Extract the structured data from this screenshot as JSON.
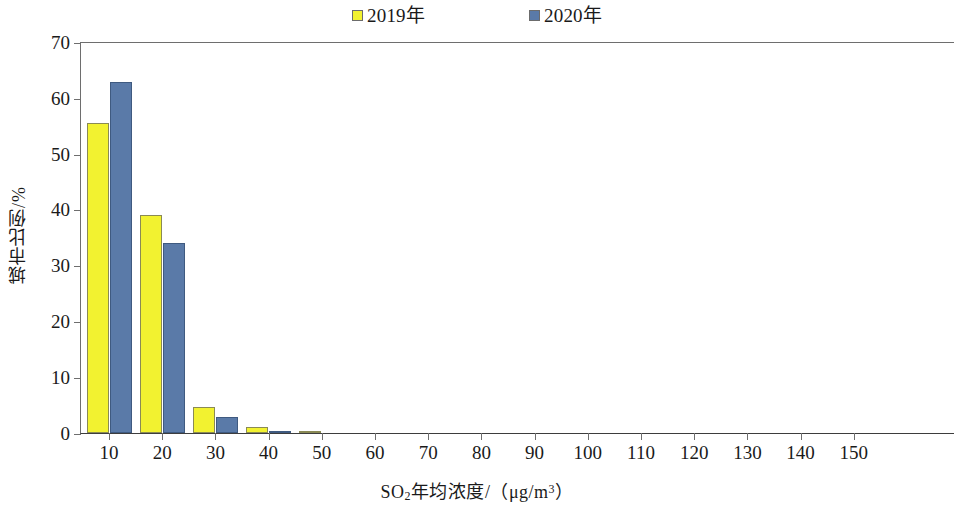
{
  "legend": {
    "entries": [
      {
        "label": "2019年",
        "color": "#f2f230"
      },
      {
        "label": "2020年",
        "color": "#5a7aa8"
      }
    ]
  },
  "axes": {
    "y_title": "城市比例/%",
    "x_title_parts": {
      "lead": "SO",
      "sub": "2",
      "mid": "年均浓度/（μg/m",
      "sup": "3",
      "tail": "）"
    },
    "x_title": "SO2年均浓度/（μg/m3）"
  },
  "chart_data": {
    "type": "bar",
    "title": "",
    "subtitle": "",
    "xlabel": "SO2年均浓度/（μg/m3）",
    "ylabel": "城市比例/%",
    "categories": [
      "10",
      "20",
      "30",
      "40",
      "50",
      "60",
      "70",
      "80",
      "90",
      "100",
      "110",
      "120",
      "130",
      "140",
      "150"
    ],
    "series": [
      {
        "name": "2019年",
        "color": "#f2f230",
        "values": [
          55.5,
          39.0,
          4.6,
          1.1,
          0.4,
          0,
          0,
          0,
          0,
          0,
          0,
          0,
          0,
          0,
          0
        ]
      },
      {
        "name": "2020年",
        "color": "#5a7aa8",
        "values": [
          63.0,
          34.0,
          2.8,
          0.35,
          0,
          0,
          0,
          0,
          0,
          0,
          0,
          0,
          0,
          0,
          0
        ]
      }
    ],
    "ylim": [
      0,
      70
    ],
    "yticks": [
      0,
      10,
      20,
      30,
      40,
      50,
      60,
      70
    ],
    "grid": false,
    "legend_position": "top-center"
  }
}
